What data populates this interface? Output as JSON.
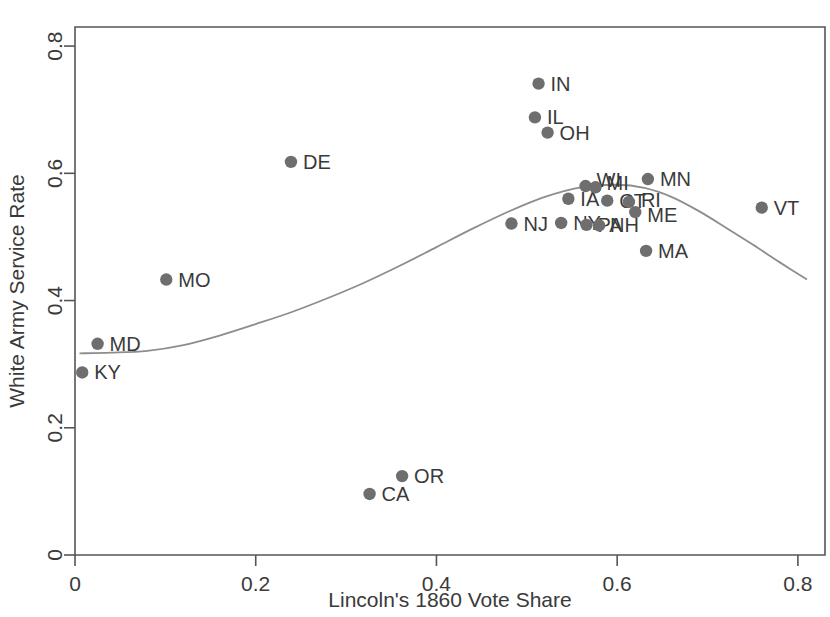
{
  "chart_data": {
    "type": "scatter",
    "title": "",
    "xlabel": "Lincoln's 1860 Vote Share",
    "ylabel": "White Army Service Rate",
    "xlim": [
      0,
      0.83
    ],
    "ylim": [
      0,
      0.83
    ],
    "xticks": [
      0,
      0.2,
      0.4,
      0.6,
      0.8
    ],
    "xticklabels": [
      "0",
      "0.2",
      "0.4",
      "0.6",
      "0.8"
    ],
    "yticks": [
      0,
      0.2,
      0.4,
      0.6,
      0.8
    ],
    "yticklabels": [
      "0",
      "0.2",
      "0.4",
      "0.6",
      "0.8"
    ],
    "grid": false,
    "legend": null,
    "marker_color": "#6e6e6e",
    "trend_color": "#8d8d8d",
    "points": [
      {
        "label": "KY",
        "x": 0.008,
        "y": 0.287,
        "label_dx": 12,
        "label_dy": 7
      },
      {
        "label": "MD",
        "x": 0.025,
        "y": 0.332,
        "label_dx": 12,
        "label_dy": 7
      },
      {
        "label": "MO",
        "x": 0.101,
        "y": 0.433,
        "label_dx": 12,
        "label_dy": 7
      },
      {
        "label": "DE",
        "x": 0.239,
        "y": 0.618,
        "label_dx": 12,
        "label_dy": 7
      },
      {
        "label": "CA",
        "x": 0.326,
        "y": 0.096,
        "label_dx": 12,
        "label_dy": 7
      },
      {
        "label": "OR",
        "x": 0.362,
        "y": 0.124,
        "label_dx": 12,
        "label_dy": 7
      },
      {
        "label": "NJ",
        "x": 0.483,
        "y": 0.521,
        "label_dx": 12,
        "label_dy": 7
      },
      {
        "label": "IN",
        "x": 0.513,
        "y": 0.741,
        "label_dx": 12,
        "label_dy": 7
      },
      {
        "label": "IL",
        "x": 0.509,
        "y": 0.688,
        "label_dx": 12,
        "label_dy": 7
      },
      {
        "label": "OH",
        "x": 0.523,
        "y": 0.664,
        "label_dx": 12,
        "label_dy": 7
      },
      {
        "label": "IA",
        "x": 0.546,
        "y": 0.56,
        "label_dx": 12,
        "label_dy": 7
      },
      {
        "label": "NY",
        "x": 0.538,
        "y": 0.522,
        "label_dx": 12,
        "label_dy": 7
      },
      {
        "label": "WI",
        "x": 0.565,
        "y": 0.58,
        "label_dx": 11,
        "label_dy": 1
      },
      {
        "label": "MI",
        "x": 0.576,
        "y": 0.578,
        "label_dx": 11,
        "label_dy": 3
      },
      {
        "label": "PA",
        "x": 0.566,
        "y": 0.519,
        "label_dx": 11,
        "label_dy": 7
      },
      {
        "label": "NH",
        "x": 0.58,
        "y": 0.518,
        "label_dx": 11,
        "label_dy": 7
      },
      {
        "label": "CT",
        "x": 0.589,
        "y": 0.557,
        "label_dx": 12,
        "label_dy": 7
      },
      {
        "label": "RI",
        "x": 0.613,
        "y": 0.555,
        "label_dx": 12,
        "label_dy": 5
      },
      {
        "label": "ME",
        "x": 0.62,
        "y": 0.539,
        "label_dx": 12,
        "label_dy": 10
      },
      {
        "label": "MN",
        "x": 0.634,
        "y": 0.591,
        "label_dx": 12,
        "label_dy": 7
      },
      {
        "label": "MA",
        "x": 0.632,
        "y": 0.478,
        "label_dx": 12,
        "label_dy": 7
      },
      {
        "label": "VT",
        "x": 0.76,
        "y": 0.546,
        "label_dx": 12,
        "label_dy": 7
      }
    ],
    "trend_line": {
      "name": "lowess-smoother",
      "x": [
        0.005,
        0.04,
        0.08,
        0.12,
        0.16,
        0.2,
        0.24,
        0.28,
        0.32,
        0.36,
        0.4,
        0.44,
        0.48,
        0.52,
        0.56,
        0.6,
        0.63,
        0.66,
        0.69,
        0.72,
        0.75,
        0.78,
        0.81
      ],
      "y": [
        0.317,
        0.318,
        0.321,
        0.33,
        0.345,
        0.363,
        0.382,
        0.404,
        0.428,
        0.455,
        0.484,
        0.513,
        0.54,
        0.563,
        0.578,
        0.582,
        0.577,
        0.563,
        0.541,
        0.515,
        0.488,
        0.46,
        0.433
      ]
    }
  }
}
